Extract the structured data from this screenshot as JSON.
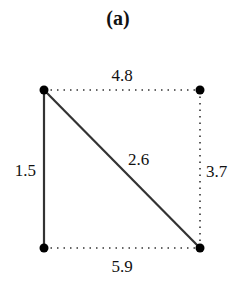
{
  "title": "(a)",
  "nodes": [
    {
      "id": "top-left",
      "x": 44,
      "y": 90
    },
    {
      "id": "top-right",
      "x": 200,
      "y": 90
    },
    {
      "id": "bottom-left",
      "x": 44,
      "y": 248
    },
    {
      "id": "bottom-right",
      "x": 200,
      "y": 248
    }
  ],
  "edges": {
    "top": {
      "label": "4.8",
      "style": "dotted"
    },
    "left": {
      "label": "1.5",
      "style": "solid"
    },
    "diagonal": {
      "label": "2.6",
      "style": "solid"
    },
    "right": {
      "label": "3.7",
      "style": "dotted"
    },
    "bottom": {
      "label": "5.9",
      "style": "dotted"
    }
  },
  "colors": {
    "line": "#333333",
    "node": "#000000"
  }
}
